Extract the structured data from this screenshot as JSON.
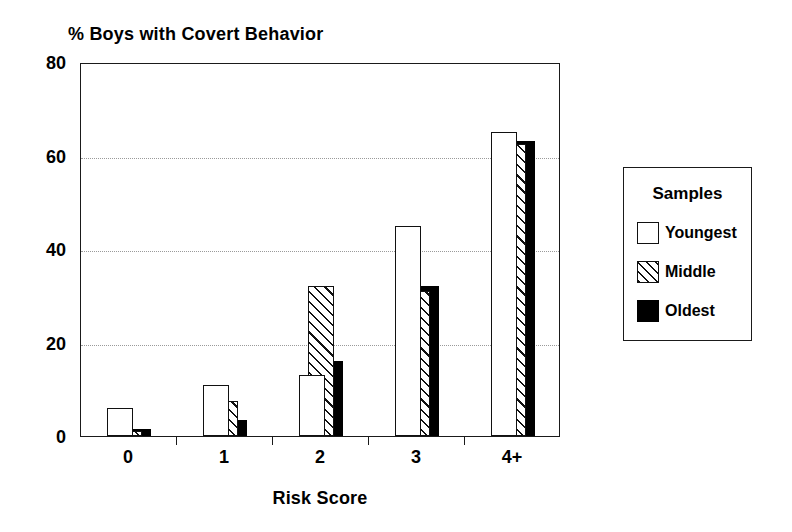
{
  "chart_data": {
    "type": "bar",
    "title": "% Boys with Covert Behavior",
    "xlabel": "Risk Score",
    "ylabel": "",
    "categories": [
      "0",
      "1",
      "2",
      "3",
      "4+"
    ],
    "series": [
      {
        "name": "Youngest",
        "fill": "white",
        "values": [
          6,
          11,
          13,
          45,
          65
        ]
      },
      {
        "name": "Middle",
        "fill": "hatch",
        "values": [
          1,
          7.5,
          32,
          31,
          62.5
        ]
      },
      {
        "name": "Oldest",
        "fill": "black",
        "values": [
          1.5,
          3.5,
          16,
          32,
          63
        ]
      }
    ],
    "ylim": [
      0,
      80
    ],
    "yticks": [
      0,
      20,
      40,
      60,
      80
    ],
    "ytick_labels": [
      "0",
      "20",
      "40",
      "60",
      "80"
    ],
    "gridlines": [
      20,
      40,
      60
    ],
    "grid": true,
    "grid_style": "dotted",
    "legend_position": "right-outside",
    "legend_title": "Samples",
    "colors": {
      "axis": "#1a1a1a",
      "grid": "#9a9a9a",
      "bar_outline": "#111111",
      "oldest_fill": "#000000",
      "background": "#ffffff"
    }
  },
  "legend": {
    "title": "Samples",
    "items": [
      {
        "label": "Youngest",
        "swatch": "white-square-icon"
      },
      {
        "label": "Middle",
        "swatch": "hatched-square-icon"
      },
      {
        "label": "Oldest",
        "swatch": "black-square-icon"
      }
    ]
  }
}
